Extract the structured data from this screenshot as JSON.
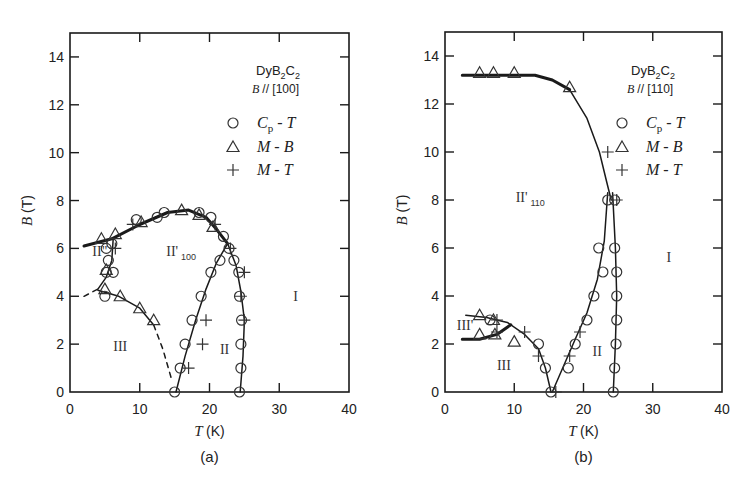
{
  "chart_data": [
    {
      "type": "scatter",
      "panel_label": "(a)",
      "title": "DyB2C2",
      "compound": "DyB2C2",
      "field_direction": "B // [100]",
      "xlabel": "T (K)",
      "ylabel": "B (T)",
      "xlim": [
        0,
        40
      ],
      "ylim": [
        0,
        15
      ],
      "xticks": [
        0,
        10,
        20,
        30,
        40
      ],
      "yticks": [
        0,
        2,
        4,
        6,
        8,
        10,
        12,
        14
      ],
      "grid": false,
      "legend_position": "upper right",
      "legend": [
        {
          "marker": "circle",
          "label": "Cp - T"
        },
        {
          "marker": "triangle",
          "label": "M - B"
        },
        {
          "marker": "plus",
          "label": "M - T"
        }
      ],
      "phase_labels": [
        {
          "text": "II\"",
          "x": 3.2,
          "y": 5.7
        },
        {
          "text": "II'",
          "sub": "100",
          "x": 13.8,
          "y": 5.7
        },
        {
          "text": "III",
          "x": 6.2,
          "y": 1.7
        },
        {
          "text": "II",
          "x": 21.5,
          "y": 1.6
        },
        {
          "text": "I",
          "x": 32,
          "y": 3.8
        }
      ],
      "series": [
        {
          "name": "Cp - T",
          "marker": "circle",
          "points": [
            [
              5.2,
              6.0
            ],
            [
              5.5,
              5.5
            ],
            [
              6.2,
              5.0
            ],
            [
              5.2,
              5.0
            ],
            [
              5.0,
              4.0
            ],
            [
              9.5,
              7.2
            ],
            [
              12.5,
              7.3
            ],
            [
              13.5,
              7.5
            ],
            [
              18.5,
              7.5
            ],
            [
              20.2,
              7.3
            ],
            [
              22.0,
              6.5
            ],
            [
              23.5,
              5.5
            ],
            [
              24.2,
              5.0
            ],
            [
              24.3,
              4.0
            ],
            [
              24.6,
              3.0
            ],
            [
              24.5,
              2.0
            ],
            [
              24.5,
              1.0
            ],
            [
              24.3,
              0.0
            ],
            [
              15.0,
              0.0
            ],
            [
              15.8,
              1.0
            ],
            [
              16.5,
              2.0
            ],
            [
              17.5,
              3.0
            ],
            [
              18.8,
              4.0
            ],
            [
              20.2,
              5.0
            ],
            [
              21.5,
              5.5
            ],
            [
              22.8,
              6.0
            ],
            [
              6.0,
              6.2
            ]
          ]
        },
        {
          "name": "M - B",
          "marker": "triangle",
          "points": [
            [
              4.5,
              6.4
            ],
            [
              6.5,
              6.6
            ],
            [
              10.2,
              7.1
            ],
            [
              16.0,
              7.6
            ],
            [
              18.5,
              7.4
            ],
            [
              20.5,
              6.9
            ],
            [
              5.0,
              4.3
            ],
            [
              7.2,
              4.0
            ],
            [
              10.0,
              3.5
            ],
            [
              12.0,
              3.0
            ],
            [
              5.2,
              5.1
            ]
          ]
        },
        {
          "name": "M - T",
          "marker": "plus",
          "points": [
            [
              9.0,
              7.0
            ],
            [
              20.8,
              7.0
            ],
            [
              6.5,
              6.0
            ],
            [
              23.0,
              6.0
            ],
            [
              25.0,
              5.0
            ],
            [
              24.5,
              4.0
            ],
            [
              25.0,
              3.0
            ],
            [
              19.5,
              3.0
            ],
            [
              19.0,
              2.0
            ],
            [
              17.0,
              1.0
            ]
          ]
        }
      ],
      "curves": [
        {
          "name": "II'-II'' upper boundary (thick)",
          "points": [
            [
              2,
              6.1
            ],
            [
              6,
              6.4
            ],
            [
              10,
              7.0
            ],
            [
              14,
              7.5
            ],
            [
              17,
              7.6
            ],
            [
              19.5,
              7.3
            ],
            [
              21,
              6.8
            ],
            [
              22.6,
              6.2
            ]
          ]
        },
        {
          "name": "I-II' boundary",
          "points": [
            [
              21,
              6.8
            ],
            [
              22.6,
              6.2
            ],
            [
              23.8,
              5.3
            ],
            [
              24.5,
              4.2
            ],
            [
              25.0,
              3.0
            ],
            [
              24.8,
              1.5
            ],
            [
              24.4,
              0
            ]
          ]
        },
        {
          "name": "II-II' boundary",
          "points": [
            [
              15.2,
              0
            ],
            [
              16.5,
              1.5
            ],
            [
              18.0,
              3.0
            ],
            [
              19.5,
              4.3
            ],
            [
              21.0,
              5.4
            ],
            [
              22.6,
              6.2
            ]
          ]
        },
        {
          "name": "II''-II' boundary",
          "points": [
            [
              4.0,
              4.3
            ],
            [
              5.2,
              4.8
            ],
            [
              6.0,
              5.5
            ],
            [
              6.2,
              6.4
            ]
          ]
        },
        {
          "name": "III-II'' boundary",
          "points": [
            [
              4.0,
              4.25
            ],
            [
              7.0,
              4.0
            ],
            [
              10.0,
              3.5
            ],
            [
              12.0,
              2.8
            ]
          ]
        },
        {
          "name": "dashed III-II boundary",
          "dashed": true,
          "points": [
            [
              12.0,
              2.8
            ],
            [
              13.3,
              1.8
            ],
            [
              14.5,
              0.6
            ]
          ]
        },
        {
          "name": "dashed II''-III boundary",
          "dashed": true,
          "points": [
            [
              2.0,
              4.0
            ],
            [
              4.0,
              4.3
            ]
          ]
        }
      ]
    },
    {
      "type": "scatter",
      "panel_label": "(b)",
      "title": "DyB2C2",
      "compound": "DyB2C2",
      "field_direction": "B // [110]",
      "xlabel": "T (K)",
      "ylabel": "B (T)",
      "xlim": [
        0,
        40
      ],
      "ylim": [
        0,
        15
      ],
      "xticks": [
        0,
        10,
        20,
        30,
        40
      ],
      "yticks": [
        0,
        2,
        4,
        6,
        8,
        10,
        12,
        14
      ],
      "grid": false,
      "legend_position": "upper right",
      "legend": [
        {
          "marker": "circle",
          "label": "Cp - T"
        },
        {
          "marker": "triangle",
          "label": "M - B"
        },
        {
          "marker": "plus",
          "label": "M - T"
        }
      ],
      "phase_labels": [
        {
          "text": "II'",
          "sub": "110",
          "x": 10.2,
          "y": 7.9
        },
        {
          "text": "III'",
          "x": 1.7,
          "y": 2.6
        },
        {
          "text": "III",
          "x": 7.5,
          "y": 0.9
        },
        {
          "text": "II",
          "x": 21.3,
          "y": 1.5
        },
        {
          "text": "I",
          "x": 32,
          "y": 5.4
        }
      ],
      "series": [
        {
          "name": "Cp - T",
          "marker": "circle",
          "points": [
            [
              6.5,
              3.0
            ],
            [
              13.5,
              2.0
            ],
            [
              14.5,
              1.0
            ],
            [
              15.3,
              0.0
            ],
            [
              17.8,
              1.0
            ],
            [
              18.8,
              2.0
            ],
            [
              20.5,
              3.0
            ],
            [
              21.5,
              4.0
            ],
            [
              22.8,
              5.0
            ],
            [
              22.2,
              6.0
            ],
            [
              23.5,
              8.0
            ],
            [
              24.5,
              8.0
            ],
            [
              24.5,
              6.0
            ],
            [
              24.8,
              5.0
            ],
            [
              24.8,
              4.0
            ],
            [
              24.8,
              3.0
            ],
            [
              24.7,
              2.0
            ],
            [
              24.5,
              1.0
            ],
            [
              24.3,
              0.0
            ]
          ]
        },
        {
          "name": "M - B",
          "marker": "triangle",
          "points": [
            [
              5.0,
              13.3
            ],
            [
              7.0,
              13.3
            ],
            [
              10.0,
              13.3
            ],
            [
              18.0,
              12.7
            ],
            [
              5.0,
              3.2
            ],
            [
              7.0,
              3.0
            ],
            [
              5.0,
              2.4
            ],
            [
              7.2,
              2.4
            ],
            [
              10.0,
              2.1
            ]
          ]
        },
        {
          "name": "M - T",
          "marker": "plus",
          "points": [
            [
              23.5,
              10.0
            ],
            [
              24.8,
              8.0
            ],
            [
              11.5,
              2.5
            ],
            [
              13.5,
              1.5
            ],
            [
              18.0,
              1.5
            ],
            [
              19.5,
              2.5
            ],
            [
              7.5,
              3.0
            ],
            [
              7.5,
              2.5
            ],
            [
              16.0,
              0.0
            ]
          ]
        }
      ],
      "curves": [
        {
          "name": "upper critical boundary (thick)",
          "points": [
            [
              2.5,
              13.2
            ],
            [
              8,
              13.2
            ],
            [
              13,
              13.2
            ],
            [
              15.5,
              13.0
            ],
            [
              18.0,
              12.6
            ]
          ]
        },
        {
          "name": "I-II' boundary upper",
          "points": [
            [
              18.0,
              12.6
            ],
            [
              20.5,
              11.4
            ],
            [
              22.3,
              10.0
            ],
            [
              23.3,
              8.8
            ],
            [
              24.0,
              8.0
            ]
          ]
        },
        {
          "name": "II'-II boundary left",
          "points": [
            [
              15.5,
              0.0
            ],
            [
              17.0,
              1.0
            ],
            [
              18.8,
              2.2
            ],
            [
              20.5,
              3.3
            ],
            [
              22.0,
              4.7
            ],
            [
              23.0,
              6.3
            ],
            [
              23.5,
              8.3
            ]
          ]
        },
        {
          "name": "I-II boundary right",
          "points": [
            [
              24.3,
              0.0
            ],
            [
              24.6,
              2.0
            ],
            [
              24.8,
              4.0
            ],
            [
              24.6,
              6.0
            ],
            [
              24.2,
              8.3
            ]
          ]
        },
        {
          "name": "III-II' boundary",
          "points": [
            [
              3.0,
              3.2
            ],
            [
              6.0,
              3.1
            ],
            [
              9.0,
              2.9
            ],
            [
              11.5,
              2.4
            ],
            [
              13.5,
              1.8
            ],
            [
              14.5,
              1.0
            ],
            [
              15.3,
              0.0
            ]
          ]
        },
        {
          "name": "III'-III boundary (thick)",
          "points": [
            [
              2.5,
              2.2
            ],
            [
              5.0,
              2.2
            ],
            [
              7.5,
              2.4
            ],
            [
              9.5,
              2.8
            ]
          ]
        }
      ]
    }
  ],
  "panels": {
    "a": {
      "compound_main": "DyB",
      "compound_sub1": "2",
      "compound_mid": "C",
      "compound_sub2": "2",
      "field_dir": "B // [100]",
      "label": "(a)"
    },
    "b": {
      "compound_main": "DyB",
      "compound_sub1": "2",
      "compound_mid": "C",
      "compound_sub2": "2",
      "field_dir": "B // [110]",
      "label": "(b)"
    }
  },
  "axis": {
    "xtitle_italic": "T",
    "xtitle_unit": "(K)",
    "ytitle_italic": "B",
    "ytitle_unit": "(T)",
    "xtick_labels": [
      "0",
      "10",
      "20",
      "30",
      "40"
    ],
    "ytick_labels": [
      "0",
      "2",
      "4",
      "6",
      "8",
      "10",
      "12",
      "14"
    ]
  },
  "legend": {
    "row1": {
      "c": "C",
      "p": "p",
      "rest": " - ",
      "t": "T"
    },
    "row2": "M  -  B",
    "row3": "M  -  T"
  },
  "colors": {
    "ink": "#1a1a1a",
    "background": "#ffffff"
  }
}
